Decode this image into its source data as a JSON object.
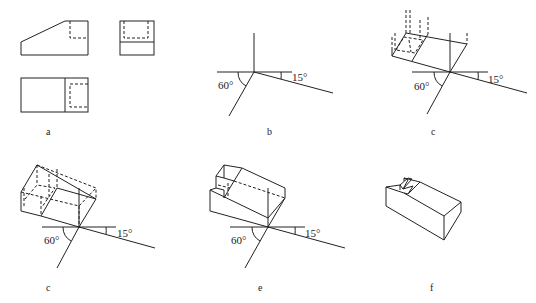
{
  "figure": {
    "panels": [
      {
        "id": "a",
        "label": "a",
        "description": "Three orthographic views (front, side, top) of a wedge block with a rectangular notch"
      },
      {
        "id": "b",
        "label": "b",
        "description": "Axonometric axes",
        "angle_left": "60°",
        "angle_right": "15°"
      },
      {
        "id": "c1",
        "label": "c",
        "description": "Projecting the notch vertices onto axes",
        "angle_left": "60°",
        "angle_right": "15°"
      },
      {
        "id": "c2",
        "label": "c",
        "description": "Constructing full bounding box",
        "angle_left": "60°",
        "angle_right": "15°"
      },
      {
        "id": "e",
        "label": "e",
        "description": "Outline with sloped face and notch",
        "angle_left": "60°",
        "angle_right": "15°"
      },
      {
        "id": "f",
        "label": "f",
        "description": "Finished oblique drawing of the block"
      }
    ]
  }
}
